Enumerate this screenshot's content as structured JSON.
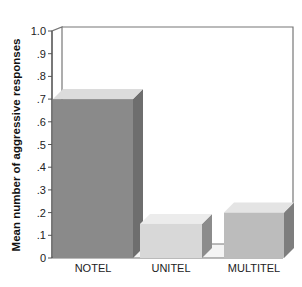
{
  "chart_data": {
    "type": "bar",
    "title": "",
    "xlabel": "",
    "ylabel": "Mean number of aggressive responses",
    "categories": [
      "NOTEL",
      "UNITEL",
      "MULTITEL"
    ],
    "values": [
      0.7,
      0.15,
      0.2
    ],
    "ylim": [
      0,
      1.0
    ],
    "yticks": [
      "0",
      ".1",
      ".2",
      ".3",
      ".4",
      ".5",
      ".6",
      ".7",
      ".8",
      ".9",
      "1.0"
    ],
    "grid": false,
    "legend": null,
    "style": "3d",
    "colors": {
      "NOTEL": {
        "front": "#8a8a8a",
        "top": "#dcdcdc",
        "side": "#6e6e6e"
      },
      "UNITEL": {
        "front": "#d8d8d8",
        "top": "#ececec",
        "side": "#8c8c8c"
      },
      "MULTITEL": {
        "front": "#bcbcbc",
        "top": "#e4e4e4",
        "side": "#7e7e7e"
      }
    }
  }
}
